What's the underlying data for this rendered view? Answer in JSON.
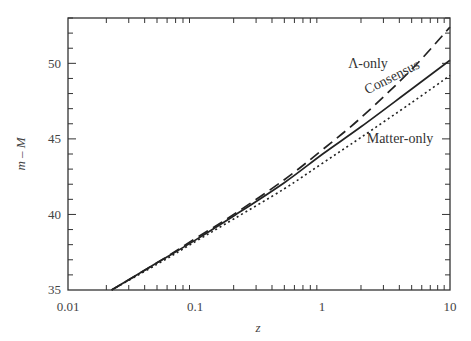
{
  "chart_data": {
    "type": "line",
    "title": "",
    "xlabel": "z",
    "ylabel": "m – M",
    "xscale": "log",
    "xlim": [
      0.01,
      10
    ],
    "ylim": [
      35,
      53
    ],
    "x_ticks": [
      "0.01",
      "0.1",
      "1",
      "10"
    ],
    "y_ticks": [
      "35",
      "40",
      "45",
      "50"
    ],
    "grid": false,
    "legend": "inline labels",
    "series": [
      {
        "name": "Λ-only",
        "style": "dashed",
        "x": [
          0.022,
          0.05,
          0.1,
          0.2,
          0.5,
          1,
          2,
          5,
          10
        ],
        "y": [
          35.0,
          36.8,
          38.4,
          40.0,
          42.3,
          44.3,
          46.4,
          49.6,
          52.4
        ]
      },
      {
        "name": "Consensus",
        "style": "solid",
        "x": [
          0.022,
          0.05,
          0.1,
          0.2,
          0.5,
          1,
          2,
          5,
          10
        ],
        "y": [
          35.0,
          36.8,
          38.3,
          39.9,
          42.1,
          44.0,
          45.8,
          48.3,
          50.2
        ]
      },
      {
        "name": "Matter-only",
        "style": "dotted",
        "x": [
          0.022,
          0.05,
          0.1,
          0.2,
          0.5,
          1,
          2,
          5,
          10
        ],
        "y": [
          35.0,
          36.7,
          38.2,
          39.7,
          41.7,
          43.4,
          45.1,
          47.4,
          49.2
        ]
      }
    ],
    "annotations": [
      {
        "text": "Λ-only",
        "near_series": "Λ-only"
      },
      {
        "text": "Consensus",
        "near_series": "Consensus"
      },
      {
        "text": "Matter-only",
        "near_series": "Matter-only"
      }
    ]
  },
  "labels": {
    "xlabel": "z",
    "ylabel": "m – M",
    "xticks": [
      "0.01",
      "0.1",
      "1",
      "10"
    ],
    "yticks": [
      "35",
      "40",
      "45",
      "50"
    ],
    "lambda": "Λ-only",
    "consensus": "Consensus",
    "matter": "Matter-only"
  }
}
